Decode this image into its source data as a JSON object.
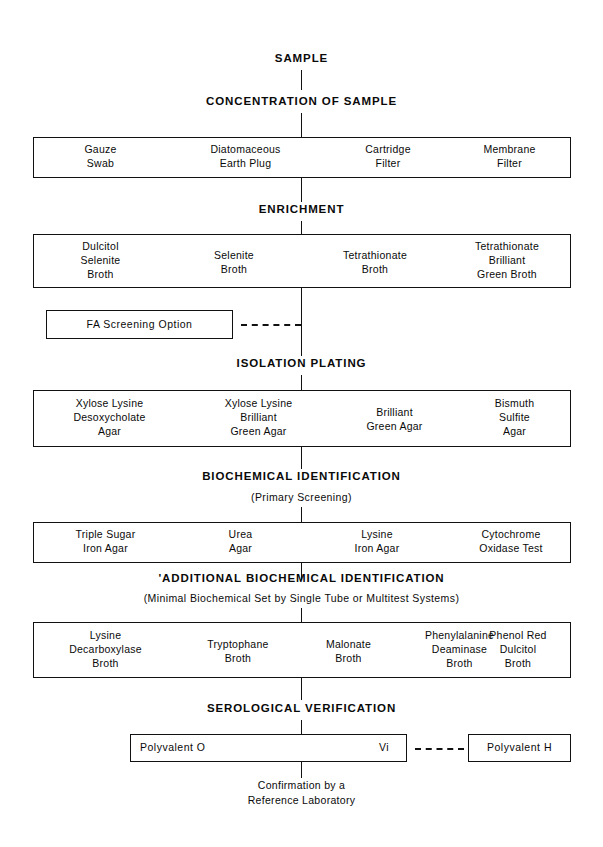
{
  "diagram": {
    "line_color": "#111111",
    "background": "#ffffff"
  },
  "stages": {
    "sample": "SAMPLE",
    "concentration": "CONCENTRATION OF SAMPLE",
    "enrichment": "ENRICHMENT",
    "isolation": "ISOLATION PLATING",
    "biochemical": "BIOCHEMICAL IDENTIFICATION",
    "biochemical_sub": "(Primary Screening)",
    "additional": "'ADDITIONAL BIOCHEMICAL IDENTIFICATION",
    "additional_sub": "(Minimal Biochemical Set by Single Tube or Multitest Systems)",
    "serological": "SEROLOGICAL VERIFICATION"
  },
  "rows": {
    "concentration": [
      "Gauze\nSwab",
      "Diatomaceous\nEarth Plug",
      "Cartridge\nFilter",
      "Membrane\nFilter"
    ],
    "enrichment": [
      "Dulcitol\nSelenite\nBroth",
      "Selenite\nBroth",
      "Tetrathionate\nBroth",
      "Tetrathionate\nBrilliant\nGreen Broth"
    ],
    "isolation": [
      "Xylose Lysine\nDesoxycholate\nAgar",
      "Xylose Lysine\nBrilliant\nGreen Agar",
      "Brilliant\nGreen Agar",
      "Bismuth\nSulfite\nAgar"
    ],
    "biochemical": [
      "Triple Sugar\nIron Agar",
      "Urea\nAgar",
      "Lysine\nIron Agar",
      "Cytochrome\nOxidase Test"
    ],
    "additional": [
      "Lysine\nDecarboxylase\nBroth",
      "Tryptophane\nBroth",
      "Malonate\nBroth",
      "Phenylalanine\nDeaminase\nBroth",
      "Phenol Red\nDulcitol\nBroth"
    ]
  },
  "options": {
    "fa_screening": "FA Screening Option"
  },
  "serology": {
    "polyvalent_o": "Polyvalent O",
    "vi": "Vi",
    "polyvalent_h": "Polyvalent H"
  },
  "footnote": {
    "line1": "Confirmation by a",
    "line2": "Reference Laboratory"
  }
}
